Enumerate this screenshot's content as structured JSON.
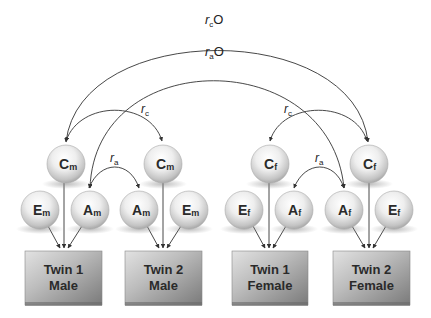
{
  "diagram": {
    "type": "twin-ACE-opposite-sex-model",
    "path_labels": {
      "rc_outer": {
        "main": "r",
        "sub": "c",
        "suffix": "O"
      },
      "ra_outer": {
        "main": "r",
        "sub": "a",
        "suffix": "O"
      },
      "rc_male": {
        "main": "r",
        "sub": "c"
      },
      "ra_male": {
        "main": "r",
        "sub": "a"
      },
      "rc_female": {
        "main": "r",
        "sub": "c"
      },
      "ra_female": {
        "main": "r",
        "sub": "a"
      }
    },
    "groups": [
      {
        "id": "twin1-male",
        "box": {
          "line1": "Twin 1",
          "line2": "Male"
        },
        "nodes": {
          "C": {
            "letter": "C",
            "sub": "m"
          },
          "E": {
            "letter": "E",
            "sub": "m"
          },
          "A": {
            "letter": "A",
            "sub": "m"
          }
        }
      },
      {
        "id": "twin2-male",
        "box": {
          "line1": "Twin 2",
          "line2": "Male"
        },
        "nodes": {
          "C": {
            "letter": "C",
            "sub": "m"
          },
          "A": {
            "letter": "A",
            "sub": "m"
          },
          "E": {
            "letter": "E",
            "sub": "m"
          }
        }
      },
      {
        "id": "twin1-female",
        "box": {
          "line1": "Twin 1",
          "line2": "Female"
        },
        "nodes": {
          "C": {
            "letter": "C",
            "sub": "f"
          },
          "E": {
            "letter": "E",
            "sub": "f"
          },
          "A": {
            "letter": "A",
            "sub": "f"
          }
        }
      },
      {
        "id": "twin2-female",
        "box": {
          "line1": "Twin 2",
          "line2": "Female"
        },
        "nodes": {
          "C": {
            "letter": "C",
            "sub": "f"
          },
          "A": {
            "letter": "A",
            "sub": "f"
          },
          "E": {
            "letter": "E",
            "sub": "f"
          }
        }
      }
    ],
    "colors": {
      "line": "#333333",
      "node_light": "#ffffff",
      "node_dark": "#9a9a9a",
      "box_light": "#d8d8d8",
      "box_dark": "#7a7a7a"
    }
  }
}
